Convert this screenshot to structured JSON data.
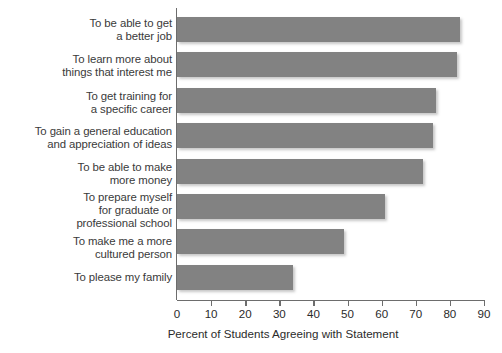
{
  "chart_data": {
    "type": "bar",
    "orientation": "horizontal",
    "title": "",
    "xlabel": "Percent of Students Agreeing with Statement",
    "ylabel": "",
    "xlim": [
      0,
      90
    ],
    "xticks": [
      0,
      10,
      20,
      30,
      40,
      50,
      60,
      70,
      80,
      90
    ],
    "grid": false,
    "legend": null,
    "bar_color": "#828282",
    "axis_color": "#6d6d6d",
    "categories": [
      "To be able to get\na better job",
      "To learn more about\nthings that interest me",
      "To get training for\na specific career",
      "To gain a general education\nand appreciation of ideas",
      "To be able to make\nmore money",
      "To prepare myself\nfor graduate or\nprofessional school",
      "To make me a more\ncultured person",
      "To please my family"
    ],
    "values": [
      83,
      82,
      76,
      75,
      72,
      61,
      49,
      34
    ]
  },
  "axis": {
    "tick_labels": [
      "0",
      "10",
      "20",
      "30",
      "40",
      "50",
      "60",
      "70",
      "80",
      "90"
    ],
    "title": "Percent of Students Agreeing with Statement"
  }
}
